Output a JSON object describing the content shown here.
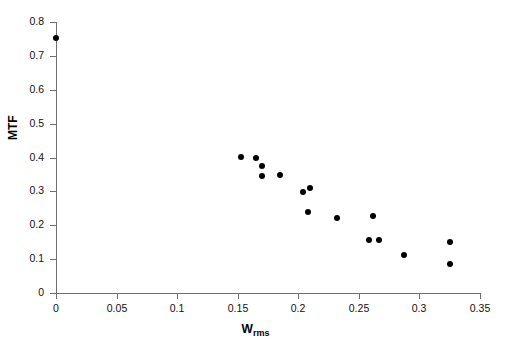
{
  "chart_data": {
    "type": "scatter",
    "title": "",
    "xlabel": "W",
    "xlabel_sub": "rms",
    "ylabel": "MTF",
    "xlim": [
      0,
      0.35
    ],
    "ylim": [
      0,
      0.8
    ],
    "xticks": [
      "0",
      "0.05",
      "0.1",
      "0.15",
      "0.2",
      "0.25",
      "0.3",
      "0.35"
    ],
    "xtick_values": [
      0,
      0.05,
      0.1,
      0.15,
      0.2,
      0.25,
      0.3,
      0.35
    ],
    "yticks": [
      "0",
      "0.1",
      "0.2",
      "0.3",
      "0.4",
      "0.5",
      "0.6",
      "0.7",
      "0.8"
    ],
    "ytick_values": [
      0,
      0.1,
      0.2,
      0.3,
      0.4,
      0.5,
      0.6,
      0.7,
      0.8
    ],
    "grid": false,
    "legend": false,
    "marker": "filled-circle",
    "marker_color": "#000000",
    "axis_color": "#6f6f6f",
    "background": "#ffffff",
    "points": [
      {
        "x": 0.0,
        "y": 0.752
      },
      {
        "x": 0.153,
        "y": 0.402
      },
      {
        "x": 0.165,
        "y": 0.398
      },
      {
        "x": 0.17,
        "y": 0.375
      },
      {
        "x": 0.17,
        "y": 0.345
      },
      {
        "x": 0.185,
        "y": 0.348
      },
      {
        "x": 0.204,
        "y": 0.298
      },
      {
        "x": 0.21,
        "y": 0.31
      },
      {
        "x": 0.208,
        "y": 0.239
      },
      {
        "x": 0.232,
        "y": 0.221
      },
      {
        "x": 0.262,
        "y": 0.227
      },
      {
        "x": 0.258,
        "y": 0.157
      },
      {
        "x": 0.267,
        "y": 0.157
      },
      {
        "x": 0.287,
        "y": 0.112
      },
      {
        "x": 0.325,
        "y": 0.15
      },
      {
        "x": 0.325,
        "y": 0.086
      }
    ]
  }
}
